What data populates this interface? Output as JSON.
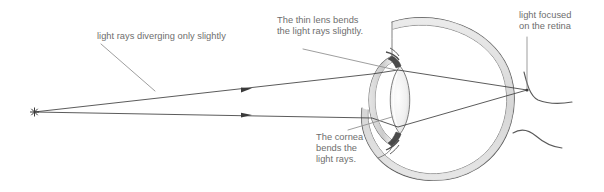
{
  "figure": {
    "background_color": "#ffffff",
    "text_color": "#6e6e6e",
    "ray_color": "#3d3d3d",
    "outline_color": "#4a4a4a",
    "shade_color": "#d7d7d7"
  },
  "annotations": {
    "diverging": {
      "text": "light rays diverging only slightly",
      "leader": "line from label down-right to upper ray"
    },
    "lens": {
      "text": "The thin lens bends\nthe light rays slightly.",
      "leader": "line from label down-right to lens"
    },
    "cornea": {
      "text": "The cornea\nbends the\nlight rays.",
      "leader": "line from label up-right to cornea"
    },
    "retina": {
      "text": "light focused\non the retina",
      "leader": "vertical line from label down to retina focus point"
    }
  },
  "optics": {
    "source_marker": "asterisk",
    "source_point": {
      "x": 34,
      "y": 112
    },
    "focus_point": {
      "x": 527,
      "y": 90
    },
    "rays": [
      {
        "name": "upper-ray",
        "arrow_at": {
          "x": 248,
          "y": 88
        },
        "path": "source -> cornea(372,74) -> lens(398,70) -> retina"
      },
      {
        "name": "lower-ray",
        "arrow_at": {
          "x": 248,
          "y": 115
        },
        "path": "source -> cornea(372,118) -> lens(398,127) -> retina"
      }
    ]
  },
  "anatomy": {
    "parts": [
      {
        "name": "sclera",
        "label": "eyeball outer wall"
      },
      {
        "name": "cornea",
        "label": "cornea"
      },
      {
        "name": "lens",
        "label": "lens"
      },
      {
        "name": "ciliary-body-upper",
        "label": "ciliary body"
      },
      {
        "name": "ciliary-body-lower",
        "label": "ciliary body"
      },
      {
        "name": "retina",
        "label": "retina"
      },
      {
        "name": "optic-nerve",
        "label": "optic nerve"
      }
    ]
  }
}
